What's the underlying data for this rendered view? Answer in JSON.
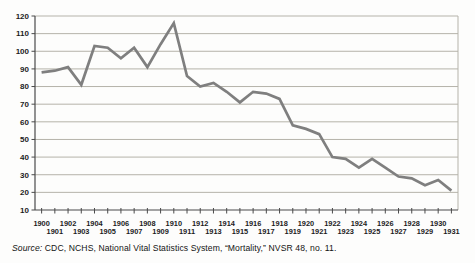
{
  "chart_data": {
    "type": "line",
    "title": "",
    "xlabel": "",
    "ylabel": "",
    "years": [
      1900,
      1901,
      1902,
      1903,
      1904,
      1905,
      1906,
      1907,
      1908,
      1909,
      1910,
      1911,
      1912,
      1913,
      1914,
      1915,
      1916,
      1917,
      1918,
      1919,
      1920,
      1921,
      1922,
      1923,
      1924,
      1925,
      1926,
      1927,
      1928,
      1929,
      1930,
      1931
    ],
    "values": [
      88,
      89,
      91,
      81,
      103,
      102,
      96,
      102,
      91,
      104,
      116,
      86,
      80,
      82,
      77,
      71,
      77,
      76,
      73,
      58,
      56,
      53,
      40,
      39,
      34,
      39,
      34,
      29,
      28,
      24,
      27,
      21
    ],
    "ylim": [
      10,
      120
    ],
    "ytick_step": 10,
    "grid": "horizontal",
    "legend": "none",
    "line_color": "#7f7f7f",
    "gridline_color": "#b5b3aa",
    "axis_color": "#4a4a4a"
  },
  "source_note": {
    "label": "Source:",
    "text": " CDC, NCHS, National Vital Statistics System, “Mortality,” NVSR 48, no. 11."
  }
}
